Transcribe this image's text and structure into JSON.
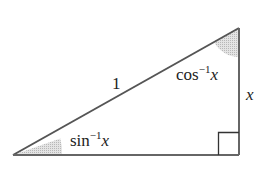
{
  "diagram": {
    "type": "right-triangle",
    "labels": {
      "hypotenuse": "1",
      "opposite_side": "x",
      "angle_bottom_left_fn": "sin",
      "angle_bottom_left_exp": "−1",
      "angle_bottom_left_var": "x",
      "angle_top_right_fn": "cos",
      "angle_top_right_exp": "−1",
      "angle_top_right_var": "x"
    },
    "colors": {
      "stroke": "#555555",
      "angle_shade": "#c8c8c8",
      "text": "#222222"
    }
  }
}
